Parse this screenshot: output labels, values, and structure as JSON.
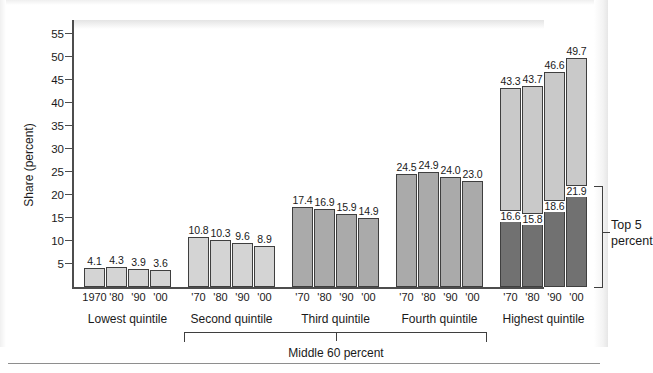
{
  "chart_data": {
    "type": "bar",
    "title": "",
    "subtitle": "",
    "xlabel": "",
    "ylabel": "Share (percent)",
    "ylim": [
      0,
      58
    ],
    "ytick_values": [
      5,
      10,
      15,
      20,
      25,
      30,
      35,
      40,
      45,
      50,
      55
    ],
    "ytick_labels": [
      "5",
      "10",
      "15",
      "20",
      "25",
      "30",
      "35",
      "40",
      "45",
      "50",
      "55"
    ],
    "grid": false,
    "legend_position": "none",
    "stacked": true,
    "colors": {
      "light_gray": "#d4d4d4",
      "medium_gray": "#aaaaaa",
      "dark_gray": "#717171",
      "bar_outline": "#3f3f3f",
      "axis": "#4d4d4d",
      "text": "#1a1a1a"
    },
    "year_labels_first_group": [
      "1970",
      "'80",
      "'90",
      "'00"
    ],
    "year_labels": [
      "'70",
      "'80",
      "'90",
      "'00"
    ],
    "groups": [
      {
        "label": "Lowest quintile",
        "fill": "#d4d4d4",
        "years": [
          "1970",
          "'80",
          "'90",
          "'00"
        ],
        "values": [
          4.1,
          4.3,
          3.9,
          3.6
        ],
        "value_labels": [
          "4.1",
          "4.3",
          "3.9",
          "3.6"
        ]
      },
      {
        "label": "Second quintile",
        "fill": "#d4d4d4",
        "years": [
          "'70",
          "'80",
          "'90",
          "'00"
        ],
        "values": [
          10.8,
          10.3,
          9.6,
          8.9
        ],
        "value_labels": [
          "10.8",
          "10.3",
          "9.6",
          "8.9"
        ]
      },
      {
        "label": "Third quintile",
        "fill": "#aaaaaa",
        "years": [
          "'70",
          "'80",
          "'90",
          "'00"
        ],
        "values": [
          17.4,
          16.9,
          15.9,
          14.9
        ],
        "value_labels": [
          "17.4",
          "16.9",
          "15.9",
          "14.9"
        ]
      },
      {
        "label": "Fourth quintile",
        "fill": "#aaaaaa",
        "years": [
          "'70",
          "'80",
          "'90",
          "'00"
        ],
        "values": [
          24.5,
          24.9,
          24.0,
          23.0
        ],
        "value_labels": [
          "24.5",
          "24.9",
          "24.0",
          "23.0"
        ]
      },
      {
        "label": "Highest quintile",
        "fill": "#c9c9c9",
        "sub_fill": "#717171",
        "years": [
          "'70",
          "'80",
          "'90",
          "'00"
        ],
        "values": [
          43.3,
          43.7,
          46.6,
          49.7
        ],
        "value_labels": [
          "43.3",
          "43.7",
          "46.6",
          "49.7"
        ],
        "sub_series_name": "Top 5 percent",
        "sub_values": [
          16.6,
          15.8,
          18.6,
          21.9
        ],
        "sub_value_labels": [
          "16.6",
          "15.8",
          "18.6",
          "21.9"
        ]
      }
    ],
    "annotations": [
      {
        "name": "middle-60-bracket",
        "text": "Middle 60 percent",
        "spans": [
          "Second quintile",
          "Third quintile",
          "Fourth quintile"
        ]
      },
      {
        "name": "top-5-bracket",
        "text": "Top 5 percent",
        "spans": [
          "Highest quintile dark segment"
        ]
      }
    ]
  }
}
